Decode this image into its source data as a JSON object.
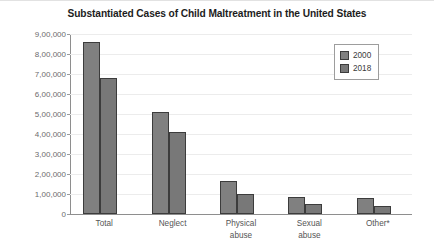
{
  "chart_data": {
    "type": "bar",
    "title": "Substantiated Cases of Child Maltreatment in the United States",
    "xlabel": "",
    "ylabel": "",
    "categories": [
      "Total",
      "Neglect",
      "Physical abuse",
      "Sexual abuse",
      "Other*"
    ],
    "series": [
      {
        "name": "2000",
        "values": [
          860000,
          510000,
          165000,
          87000,
          82000
        ]
      },
      {
        "name": "2018",
        "values": [
          678000,
          410000,
          100000,
          48000,
          40000
        ]
      }
    ],
    "ylim": [
      0,
      900000
    ],
    "ytick_values": [
      0,
      100000,
      200000,
      300000,
      400000,
      500000,
      600000,
      700000,
      800000,
      900000
    ],
    "ytick_labels": [
      "0",
      "1,00,000",
      "2,00,000",
      "3,00,000",
      "4,00,000",
      "5,00,000",
      "6,00,000",
      "7,00,000",
      "8,00,000",
      "9,00,000"
    ],
    "grid": true,
    "legend_position": "top-right",
    "colors": {
      "series_2000": "#808080",
      "series_2018": "#787878",
      "bar_outline": "#3c3c3c",
      "gridline": "#ececec",
      "axis": "#8e8e8e",
      "title_text": "#1d1d1d",
      "tick_text": "#6c6c6c",
      "background": "#ffffff"
    }
  },
  "legend": {
    "items": [
      {
        "label": "2000"
      },
      {
        "label": "2018"
      }
    ]
  }
}
